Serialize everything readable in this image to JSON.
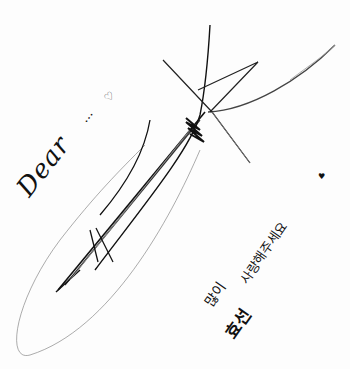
{
  "image": {
    "description": "Handwritten autograph signature on white paper",
    "background": "#ffffff",
    "ink": "#111111"
  },
  "text": {
    "greeting": "Dear",
    "ellipsis": "...",
    "heart": "♡",
    "message_line1": "사랑해주세요",
    "message_heart": "♥",
    "message_line2": "많이",
    "name": "효선"
  }
}
